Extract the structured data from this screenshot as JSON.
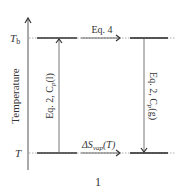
{
  "diagram": {
    "axis_label": "Temperature",
    "levels": {
      "top": {
        "symbol": "T",
        "subscript": "b"
      },
      "bottom": {
        "symbol": "T",
        "subscript": ""
      }
    },
    "arrows": {
      "top_horizontal": "Eq. 4",
      "bottom_horizontal_prefix": "ΔS",
      "bottom_horizontal_sub": "vap",
      "bottom_horizontal_suffix": "(T)",
      "left_vertical": "Eq. 2, C",
      "left_vertical_sub": "p",
      "left_vertical_suffix": "(l)",
      "right_vertical": "Eq. 2, C",
      "right_vertical_sub": "p",
      "right_vertical_suffix": "(g)"
    },
    "figure_number": "1"
  }
}
